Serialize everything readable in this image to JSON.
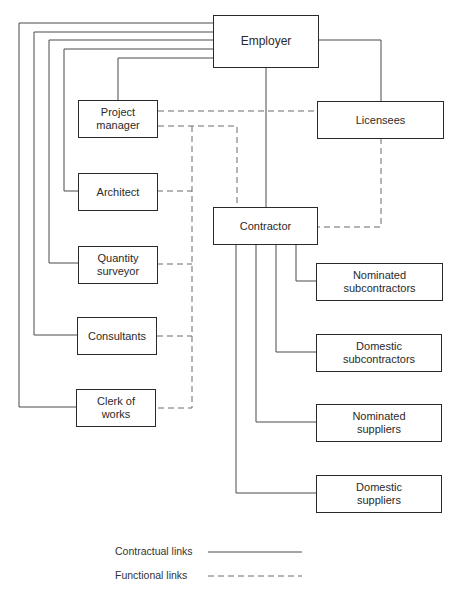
{
  "diagram": {
    "type": "organization-chart",
    "nodes": {
      "employer": "Employer",
      "project_manager": "Project\nmanager",
      "licensees": "Licensees",
      "architect": "Architect",
      "contractor": "Contractor",
      "quantity_surveyor": "Quantity\nsurveyor",
      "consultants": "Consultants",
      "clerk_of_works": "Clerk of\nworks",
      "nominated_subcontractors": "Nominated\nsubcontractors",
      "domestic_subcontractors": "Domestic\nsubcontractors",
      "nominated_suppliers": "Nominated\nsuppliers",
      "domestic_suppliers": "Domestic\nsuppliers"
    },
    "contractual_links": [
      [
        "Employer",
        "Project manager"
      ],
      [
        "Employer",
        "Architect"
      ],
      [
        "Employer",
        "Quantity surveyor"
      ],
      [
        "Employer",
        "Consultants"
      ],
      [
        "Employer",
        "Clerk of works"
      ],
      [
        "Employer",
        "Contractor"
      ],
      [
        "Employer",
        "Licensees"
      ],
      [
        "Contractor",
        "Nominated subcontractors"
      ],
      [
        "Contractor",
        "Domestic subcontractors"
      ],
      [
        "Contractor",
        "Nominated suppliers"
      ],
      [
        "Contractor",
        "Domestic suppliers"
      ]
    ],
    "functional_links": [
      [
        "Project manager",
        "Licensees"
      ],
      [
        "Project manager",
        "Contractor"
      ],
      [
        "Architect",
        "Contractor"
      ],
      [
        "Quantity surveyor",
        "Contractor"
      ],
      [
        "Consultants",
        "Contractor"
      ],
      [
        "Clerk of works",
        "Contractor"
      ],
      [
        "Licensees",
        "Contractor"
      ]
    ]
  },
  "legend": {
    "contractual": "Contractual links",
    "functional": "Functional links"
  }
}
